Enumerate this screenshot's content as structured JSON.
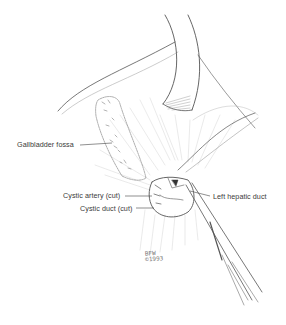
{
  "figure": {
    "type": "surgical illustration",
    "labels": {
      "gallbladder_fossa": "Gallbladder fossa",
      "cystic_artery": "Cystic artery (cut)",
      "cystic_duct": "Cystic duct (cut)",
      "left_hepatic_duct": "Left hepatic duct"
    },
    "signature": {
      "initials": "BFW",
      "year": "©1993"
    },
    "colors": {
      "background": "#ffffff",
      "ink": "#3a3a3a",
      "light_ink": "#b5b5b5"
    }
  }
}
